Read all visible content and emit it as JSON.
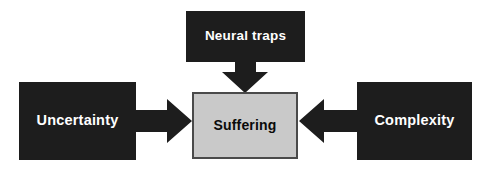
{
  "diagram": {
    "type": "flow-diagram",
    "background_color": "#ffffff",
    "canvas": {
      "width": 485,
      "height": 180
    },
    "nodes": [
      {
        "id": "uncertainty",
        "label": "Uncertainty",
        "fill": "#1d1d1d",
        "text_color": "#ffffff",
        "position": "left"
      },
      {
        "id": "neural_traps",
        "label": "Neural traps",
        "fill": "#1d1d1d",
        "text_color": "#ffffff",
        "position": "top-center"
      },
      {
        "id": "complexity",
        "label": "Complexity",
        "fill": "#1d1d1d",
        "text_color": "#ffffff",
        "position": "right"
      },
      {
        "id": "suffering",
        "label": "Suffering",
        "fill": "#c9c9c9",
        "text_color": "#0a0a0a",
        "border_color": "#4a4a4a",
        "position": "center"
      }
    ],
    "arrows": [
      {
        "id": "uncertainty-to-suffering",
        "from": "uncertainty",
        "to": "suffering",
        "direction": "right",
        "color": "#1d1d1d"
      },
      {
        "id": "neural-traps-to-suffering",
        "from": "neural_traps",
        "to": "suffering",
        "direction": "down",
        "color": "#1d1d1d"
      },
      {
        "id": "complexity-to-suffering",
        "from": "complexity",
        "to": "suffering",
        "direction": "left",
        "color": "#1d1d1d"
      }
    ]
  }
}
